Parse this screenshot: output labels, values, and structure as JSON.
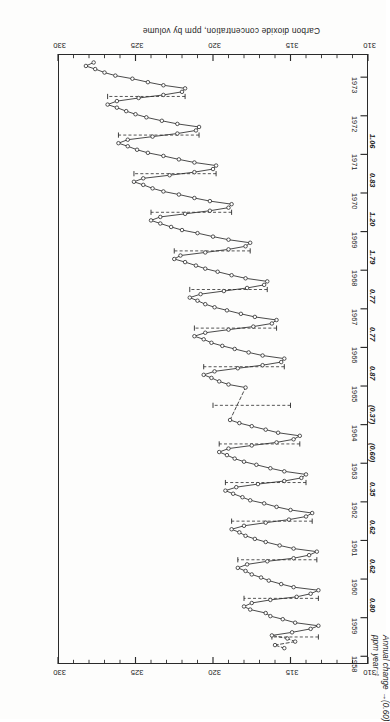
{
  "figure": {
    "orientation_note": "rotated-180",
    "yaxis_label": "Carbon dioxide concentration, ppm by volume",
    "annual_change_label_line1": "Annual change",
    "annual_change_label_line2": "ppm year⁻¹",
    "annual_change_leader": "—(0.60)",
    "ppm_ticks": [
      "310",
      "315",
      "320",
      "325",
      "330"
    ],
    "year_ticks": [
      "1958",
      "1959",
      "1960",
      "1961",
      "1962",
      "1963",
      "1964",
      "1965",
      "1966",
      "1967",
      "1968",
      "1969",
      "1970",
      "1971",
      "1972",
      "1973"
    ],
    "annual_change_values": [
      {
        "year": "1959",
        "value": "0.80"
      },
      {
        "year": "1960",
        "value": "0.62"
      },
      {
        "year": "1961",
        "value": "0.62"
      },
      {
        "year": "1962",
        "value": "0.35"
      },
      {
        "year": "1963",
        "value": "(0.60)"
      },
      {
        "year": "1964",
        "value": "(0.37)"
      },
      {
        "year": "1965",
        "value": "0.87"
      },
      {
        "year": "1966",
        "value": "0.77"
      },
      {
        "year": "1967",
        "value": "0.77"
      },
      {
        "year": "1968",
        "value": "1.79"
      },
      {
        "year": "1969",
        "value": "1.20"
      },
      {
        "year": "1970",
        "value": "0.83"
      },
      {
        "year": "1971",
        "value": "1.06"
      }
    ]
  },
  "chart_data": {
    "type": "line",
    "title": "",
    "xlabel": "",
    "ylabel": "Carbon dioxide concentration, ppm by volume",
    "xlim": [
      1957.8,
      1973.6
    ],
    "ylim": [
      310,
      330
    ],
    "grid": false,
    "legend_position": "none",
    "marker": "open-circle",
    "xtick_labels": [
      "1958",
      "1959",
      "1960",
      "1961",
      "1962",
      "1963",
      "1964",
      "1965",
      "1966",
      "1967",
      "1968",
      "1969",
      "1970",
      "1971",
      "1972",
      "1973"
    ],
    "ytick_labels": [
      "310",
      "315",
      "320",
      "325",
      "330"
    ],
    "ytick_values": [
      310,
      315,
      320,
      325,
      330
    ],
    "minor_tick_interval_y": 1,
    "series": [
      {
        "name": "Monthly mean CO2 (Mauna Loa)",
        "style": "solid-with-open-circles",
        "x": [
          1958.21,
          1958.29,
          1958.38,
          1958.46,
          1958.54,
          1958.62,
          1958.71,
          1958.79,
          1958.87,
          1958.96,
          1959.04,
          1959.12,
          1959.21,
          1959.29,
          1959.38,
          1959.46,
          1959.54,
          1959.62,
          1959.71,
          1959.79,
          1959.87,
          1959.96,
          1960.04,
          1960.12,
          1960.21,
          1960.29,
          1960.38,
          1960.46,
          1960.54,
          1960.62,
          1960.71,
          1960.79,
          1960.87,
          1960.96,
          1961.04,
          1961.12,
          1961.21,
          1961.29,
          1961.38,
          1961.46,
          1961.54,
          1961.62,
          1961.71,
          1961.79,
          1961.87,
          1961.96,
          1962.04,
          1962.12,
          1962.21,
          1962.29,
          1962.38,
          1962.46,
          1962.54,
          1962.62,
          1962.71,
          1962.79,
          1962.87,
          1962.96,
          1963.04,
          1963.12,
          1963.21,
          1963.29,
          1963.38,
          1963.46,
          1963.54,
          1963.62,
          1963.71,
          1963.79,
          1963.87,
          1963.96,
          1964.04,
          1964.12,
          1964.96,
          1965.04,
          1965.12,
          1965.21,
          1965.29,
          1965.38,
          1965.46,
          1965.54,
          1965.62,
          1965.71,
          1965.79,
          1965.87,
          1965.96,
          1966.04,
          1966.12,
          1966.21,
          1966.29,
          1966.38,
          1966.46,
          1966.54,
          1966.62,
          1966.71,
          1966.79,
          1966.87,
          1966.96,
          1967.04,
          1967.12,
          1967.21,
          1967.29,
          1967.38,
          1967.46,
          1967.54,
          1967.62,
          1967.71,
          1967.79,
          1967.87,
          1967.96,
          1968.04,
          1968.12,
          1968.21,
          1968.29,
          1968.38,
          1968.46,
          1968.54,
          1968.62,
          1968.71,
          1968.79,
          1968.87,
          1968.96,
          1969.04,
          1969.12,
          1969.21,
          1969.29,
          1969.38,
          1969.46,
          1969.54,
          1969.62,
          1969.71,
          1969.79,
          1969.87,
          1969.96,
          1970.04,
          1970.12,
          1970.21,
          1970.29,
          1970.38,
          1970.46,
          1970.54,
          1970.62,
          1970.71,
          1970.79,
          1970.87,
          1970.96,
          1971.04,
          1971.12,
          1971.21,
          1971.29,
          1971.38,
          1971.46,
          1971.54,
          1971.62,
          1971.71,
          1971.79,
          1971.87,
          1971.96,
          1972.04,
          1972.12,
          1972.21,
          1972.29,
          1972.38,
          1972.46,
          1972.54,
          1972.62,
          1972.71,
          1972.79,
          1972.87,
          1972.96,
          1973.04,
          1973.12,
          1973.21,
          1973.29,
          1973.38
        ],
        "y": [
          315.4,
          316.0,
          314.7,
          315.2,
          316.2,
          314.9,
          313.7,
          313.2,
          314.7,
          315.5,
          316.3,
          316.6,
          317.6,
          318.0,
          317.5,
          316.3,
          314.6,
          313.7,
          313.2,
          314.8,
          315.6,
          316.4,
          316.9,
          317.5,
          317.9,
          318.4,
          317.8,
          316.5,
          314.8,
          313.8,
          313.3,
          314.8,
          315.7,
          316.6,
          317.3,
          317.9,
          318.3,
          318.8,
          318.0,
          316.6,
          315.1,
          314.0,
          313.6,
          315.0,
          315.9,
          316.7,
          317.6,
          318.1,
          318.7,
          319.2,
          318.5,
          317.1,
          315.4,
          314.3,
          314.0,
          315.4,
          316.3,
          317.2,
          318.0,
          318.6,
          319.1,
          319.6,
          319.0,
          317.5,
          315.9,
          314.8,
          314.4,
          315.8,
          316.6,
          317.5,
          318.3,
          318.9,
          317.9,
          319.0,
          319.6,
          320.1,
          320.6,
          319.9,
          318.4,
          316.8,
          315.6,
          315.4,
          316.8,
          317.7,
          318.6,
          319.4,
          320.1,
          320.6,
          321.2,
          320.5,
          319.0,
          317.4,
          316.2,
          315.9,
          317.3,
          318.2,
          319.1,
          319.9,
          320.5,
          321.0,
          321.5,
          320.8,
          319.3,
          317.8,
          316.7,
          316.5,
          317.9,
          318.8,
          319.7,
          320.5,
          321.1,
          321.8,
          322.5,
          322.1,
          320.5,
          319.0,
          317.9,
          317.6,
          319.0,
          320.0,
          321.0,
          322.0,
          322.7,
          323.4,
          324.0,
          323.4,
          321.8,
          320.2,
          319.0,
          318.8,
          320.2,
          321.2,
          322.2,
          323.2,
          323.9,
          324.5,
          325.1,
          324.5,
          322.8,
          321.2,
          320.0,
          319.8,
          321.2,
          322.2,
          323.2,
          324.2,
          324.9,
          325.5,
          326.1,
          325.5,
          323.9,
          322.3,
          321.1,
          320.9,
          322.3,
          323.3,
          324.3,
          325.0,
          325.6,
          326.2,
          326.8,
          326.2,
          324.8,
          323.2,
          322.0,
          321.8,
          323.2,
          324.2,
          325.2,
          326.3,
          327.0,
          327.6,
          328.2,
          327.7
        ]
      }
    ],
    "dashed_segments_note": "Interpolated/missing-data spans drawn as dashed lines (early 1958 and mid-1964)",
    "annual_change_markers": [
      {
        "year": 1958.5,
        "from": 313.2,
        "to": 316.2
      },
      {
        "year": 1959.5,
        "from": 313.2,
        "to": 318.0
      },
      {
        "year": 1960.5,
        "from": 313.3,
        "to": 318.4
      },
      {
        "year": 1961.5,
        "from": 313.6,
        "to": 318.8
      },
      {
        "year": 1962.5,
        "from": 314.0,
        "to": 319.2
      },
      {
        "year": 1963.5,
        "from": 314.4,
        "to": 319.6
      },
      {
        "year": 1964.5,
        "from": 315.0,
        "to": 320.0
      },
      {
        "year": 1965.5,
        "from": 315.4,
        "to": 320.6
      },
      {
        "year": 1966.5,
        "from": 315.9,
        "to": 321.2
      },
      {
        "year": 1967.5,
        "from": 316.5,
        "to": 321.5
      },
      {
        "year": 1968.5,
        "from": 317.6,
        "to": 322.5
      },
      {
        "year": 1969.5,
        "from": 318.8,
        "to": 324.0
      },
      {
        "year": 1970.5,
        "from": 319.8,
        "to": 325.1
      },
      {
        "year": 1971.5,
        "from": 320.9,
        "to": 326.1
      },
      {
        "year": 1972.5,
        "from": 321.8,
        "to": 326.8
      }
    ]
  }
}
